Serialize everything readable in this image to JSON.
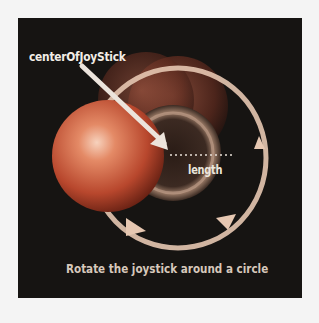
{
  "diagram": {
    "labels": {
      "center": "centerOfJoyStick",
      "length": "length",
      "caption": "Rotate the joystick around a circle"
    },
    "colors": {
      "background": "#161412",
      "page": "#f4f4f4",
      "sphere": "#d9603f",
      "ring": "#e9c2a6",
      "text": "#f2ede6"
    }
  }
}
